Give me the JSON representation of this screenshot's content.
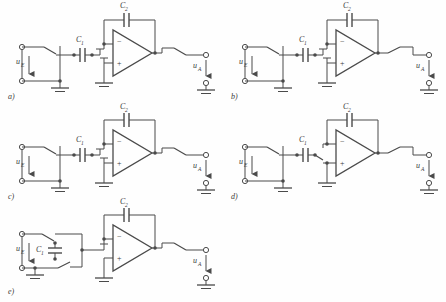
{
  "figure": {
    "type": "circuit-diagram",
    "background_color": "#fefefe",
    "line_color": "#4a4a4a",
    "text_color": "#3a3a3a"
  },
  "symbols": {
    "opamp_minus": "−",
    "opamp_plus": "+",
    "input_label": "u",
    "input_sub": "E",
    "output_label": "u",
    "output_sub": "A",
    "cap_label": "C",
    "cap1_sub": "1",
    "cap2_sub": "2"
  },
  "panels": [
    {
      "id": "a",
      "caption": "a)",
      "input": "u",
      "input_sub": "E",
      "output": "u",
      "output_sub": "A",
      "series_cap": "C",
      "series_cap_sub": "1",
      "feedback_cap": "C",
      "feedback_cap_sub": "2",
      "opamp_inverting": "−",
      "opamp_noninverting": "+",
      "switch_count": 2,
      "note": "series switch before C1, output switch after opamp, + input grounded"
    },
    {
      "id": "b",
      "caption": "b)",
      "input": "u",
      "input_sub": "E",
      "output": "u",
      "output_sub": "A",
      "series_cap": "C",
      "series_cap_sub": "1",
      "feedback_cap": "C",
      "feedback_cap_sub": "2",
      "opamp_inverting": "−",
      "opamp_noninverting": "+",
      "switch_count": 2,
      "note": "same topology as a)"
    },
    {
      "id": "c",
      "caption": "c)",
      "input": "u",
      "input_sub": "E",
      "output": "u",
      "output_sub": "A",
      "series_cap": "C",
      "series_cap_sub": "1",
      "feedback_cap": "C",
      "feedback_cap_sub": "2",
      "opamp_inverting": "−",
      "opamp_noninverting": "+",
      "switch_count": 2,
      "note": "switch feeds inverting node, + input grounded"
    },
    {
      "id": "d",
      "caption": "d)",
      "input": "u",
      "input_sub": "E",
      "output": "u",
      "output_sub": "A",
      "series_cap": "C",
      "series_cap_sub": "1",
      "feedback_cap": "C",
      "feedback_cap_sub": "2",
      "opamp_inverting": "−",
      "opamp_noninverting": "+",
      "switch_count": 2,
      "note": "switch routes to non-inverting node"
    },
    {
      "id": "e",
      "caption": "e)",
      "input": "u",
      "input_sub": "E",
      "output": "u",
      "output_sub": "A",
      "series_cap": "C",
      "series_cap_sub": "1",
      "feedback_cap": "C",
      "feedback_cap_sub": "2",
      "opamp_inverting": "−",
      "opamp_noninverting": "+",
      "switch_count": 2,
      "note": "floating switched capacitor C1 between two switch contacts"
    }
  ]
}
